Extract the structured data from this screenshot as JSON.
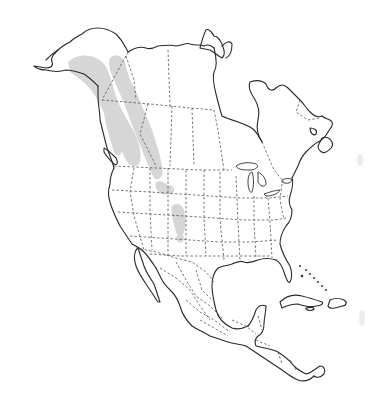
{
  "map": {
    "region": "North America",
    "style": "outline map with dashed political borders",
    "colors": {
      "background": "#ffffff",
      "coastline": "#2a2a2a",
      "borders": "#555555",
      "range_fill": "#d6d6d6"
    },
    "layers": [
      {
        "name": "coastline",
        "type": "solid-line"
      },
      {
        "name": "political-borders",
        "type": "dashed-line",
        "includes": [
          "US states",
          "Canadian provinces",
          "Mexican states"
        ]
      },
      {
        "name": "distribution-range",
        "type": "gray-fill",
        "description": "shaded range along western cordillera from Alaska through British Columbia/Alberta to Montana, Idaho, Wyoming and Colorado"
      }
    ],
    "labels": []
  }
}
